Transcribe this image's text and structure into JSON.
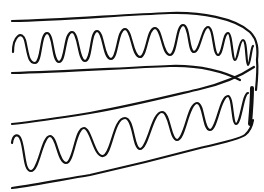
{
  "figure": {
    "background_color": "#ffffff",
    "ink_color": "#111111",
    "stroke_width": 2.2,
    "upper_band": {
      "top_edge": "M12,21 C60,20 120,15 170,13 C200,12 235,18 250,32 C258,40 258,50 257,60",
      "bottom_edge": "M12,73 C60,72 120,68 170,66 C200,65 225,72 240,80",
      "wave": "M13,52 C13,36 22,30 25,40 C28,52 28,63 35,63 C42,63 40,33 47,33 C54,33 52,62 59,62 C66,62 64,32 72,32 C79,32 78,61 85,61 C92,61 90,31 97,31 C104,31 103,59 111,59 C118,59 117,29 125,29 C132,29 132,57 140,57 C147,57 147,28 155,28 C162,28 162,55 170,55 C177,55 176,25 183,25 C190,25 188,52 194,52 C200,52 202,27 208,27 C214,27 213,55 218,55 C223,55 223,33 228,33 C232,33 232,60 235,60 C238,60 239,40 243,40 C247,40 246,65 248,65 C250,65 251,48 253,46"
    },
    "lower_band": {
      "top_edge": "M12,124 C40,121 65,117 90,113 C130,106 170,96 200,89 C225,83 242,75 254,67",
      "bottom_edge": "M12,188 C40,184 65,179 90,175 C130,166 170,156 200,148 C222,143 240,139 245,135 C250,131 252,126 253,120",
      "wave": "M12,143 C13,135 18,132 21,140 C25,152 24,171 31,171 C39,171 42,136 50,136 C57,136 58,163 66,163 C74,163 75,128 84,128 C91,128 94,157 103,156 C112,155 113,118 125,118 C134,118 133,149 140,149 C148,149 152,112 162,112 C170,112 170,140 177,140 C185,140 188,103 197,103 C204,103 203,130 210,130 C217,130 220,96 228,96 C233,96 232,124 236,124 C241,124 243,93 248,93"
    },
    "right_fold": {
      "outer_edge": "M257,60 C258,70 257,80 256,90",
      "thick_edge": "M252,88 C252,100 251,112 250,124"
    }
  }
}
